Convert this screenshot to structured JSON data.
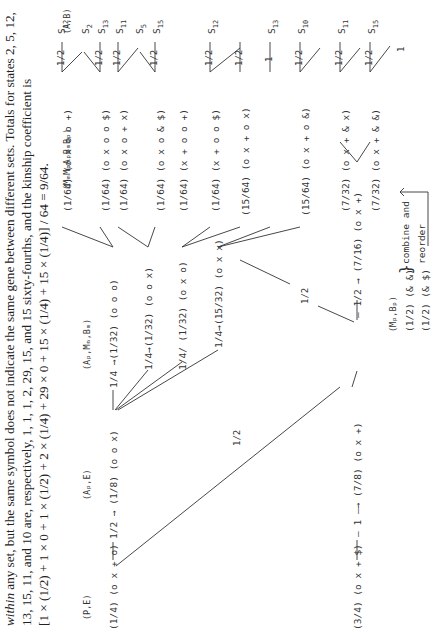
{
  "caption": {
    "line1_italic": "within",
    "line1_rest": " any set, but the same symbol does not indicate the same gene between different sets. Totals for states 2, 5, 12,",
    "line2": "13, 15, 11, and 10 are, respectively, 1, 1, 1, 2, 29, 15, and 15 sixty-fourths, and the kinship coefficient is",
    "line3": "[1 × (1/2) + 1 × 0 + 1 × (1/2) + 2 × (1/4) + 29 × 0 + 15 × (1/4) + 15 × (1/4)] / 64 = 9/64."
  },
  "column_headers": {
    "pe": "(P,E)",
    "ape": "(Aₚ,E)",
    "apmmbm": "(Aₚ,Mₘ,Bₘ)",
    "mmmpapbmbp": "(MₘMₚAₚBₘBₚ)",
    "ab": "(A,B)",
    "mpbp": "(Mₚ,Bₚ)"
  },
  "column1": [
    {
      "prob": "(1/4)",
      "genes": "(o x + o)"
    },
    {
      "prob": "(3/4)",
      "genes": "(o x + $)"
    }
  ],
  "column2": [
    {
      "edge": "1/2",
      "prob": "(1/8)",
      "genes": "(o o x)"
    },
    {
      "edge": "1",
      "prob": "(7/8)",
      "genes": "(o x +)"
    }
  ],
  "cross_edge_c1_c2": "1/2",
  "column3": [
    {
      "edge": "1/4",
      "prob": "(1/32)",
      "genes": "(o o o)"
    },
    {
      "edge": "1/4",
      "prob": "(1/32)",
      "genes": "(o o x)"
    },
    {
      "edge": "1/4",
      "prob": "(1/32)",
      "genes": "(o x o)"
    },
    {
      "edge": "1/4",
      "prob": "(15/32)",
      "genes": "(o x x)"
    },
    {
      "edge": "1/2",
      "prob": "(7/16)",
      "genes": "(o x +)"
    }
  ],
  "cross_edge_c2_c3": "1/2",
  "column4": [
    {
      "prob": "(1/64)",
      "genes": "(o x o o +)"
    },
    {
      "prob": "(1/64)",
      "genes": "(o x o o $)"
    },
    {
      "prob": "(1/64)",
      "genes": "(o x o + x)"
    },
    {
      "prob": "(1/64)",
      "genes": "(o x o & $)"
    },
    {
      "prob": "(1/64)",
      "genes": "(x + o o +)"
    },
    {
      "prob": "(1/64)",
      "genes": "(x + o o $)"
    },
    {
      "prob": "(15/64)",
      "genes": "(o x + o x)"
    },
    {
      "prob": "(15/64)",
      "genes": "(o x + o &)"
    },
    {
      "prob": "(7/32)",
      "genes": "(o x + & x)"
    },
    {
      "prob": "(7/32)",
      "genes": "(o x + & &)"
    }
  ],
  "states": {
    "s12a": {
      "s": "S",
      "n": "12"
    },
    "s2": {
      "s": "S",
      "n": "2"
    },
    "s13a": {
      "s": "S",
      "n": "13"
    },
    "s11a": {
      "s": "S",
      "n": "11"
    },
    "s5": {
      "s": "S",
      "n": "5"
    },
    "s15a": {
      "s": "S",
      "n": "15"
    },
    "s12b": {
      "s": "S",
      "n": "12"
    },
    "s13b": {
      "s": "S",
      "n": "13"
    },
    "s10": {
      "s": "S",
      "n": "10"
    },
    "s11b": {
      "s": "S",
      "n": "11"
    },
    "s15b": {
      "s": "S",
      "n": "15"
    }
  },
  "edge_labels": {
    "half": "1/2",
    "one": "1"
  },
  "mpbp_rows": [
    {
      "prob": "(1/2)",
      "genes": "(& &)"
    },
    {
      "prob": "(1/2)",
      "genes": "(& $)"
    }
  ],
  "annotation": {
    "line1": "combine and",
    "line2": "reorder"
  }
}
